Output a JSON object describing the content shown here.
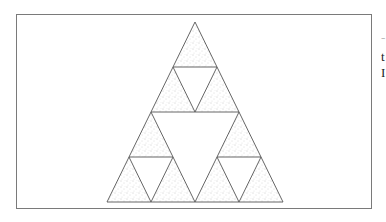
{
  "figure": {
    "type": "sierpinski-triangle",
    "level": 2,
    "outer_triangle": {
      "apex": [
        195,
        22
      ],
      "bottom_left": [
        107,
        202
      ],
      "bottom_right": [
        283,
        202
      ]
    },
    "colors": {
      "edge": "#555555",
      "fill_dot": "#9a9a9a",
      "frame": "#7a7a7a",
      "background": "#ffffff"
    }
  },
  "clipped_text": [
    {
      "char": "-",
      "top": 31,
      "faint": true
    },
    {
      "char": "t",
      "top": 50,
      "faint": false
    },
    {
      "char": "I",
      "top": 66,
      "faint": false
    }
  ]
}
